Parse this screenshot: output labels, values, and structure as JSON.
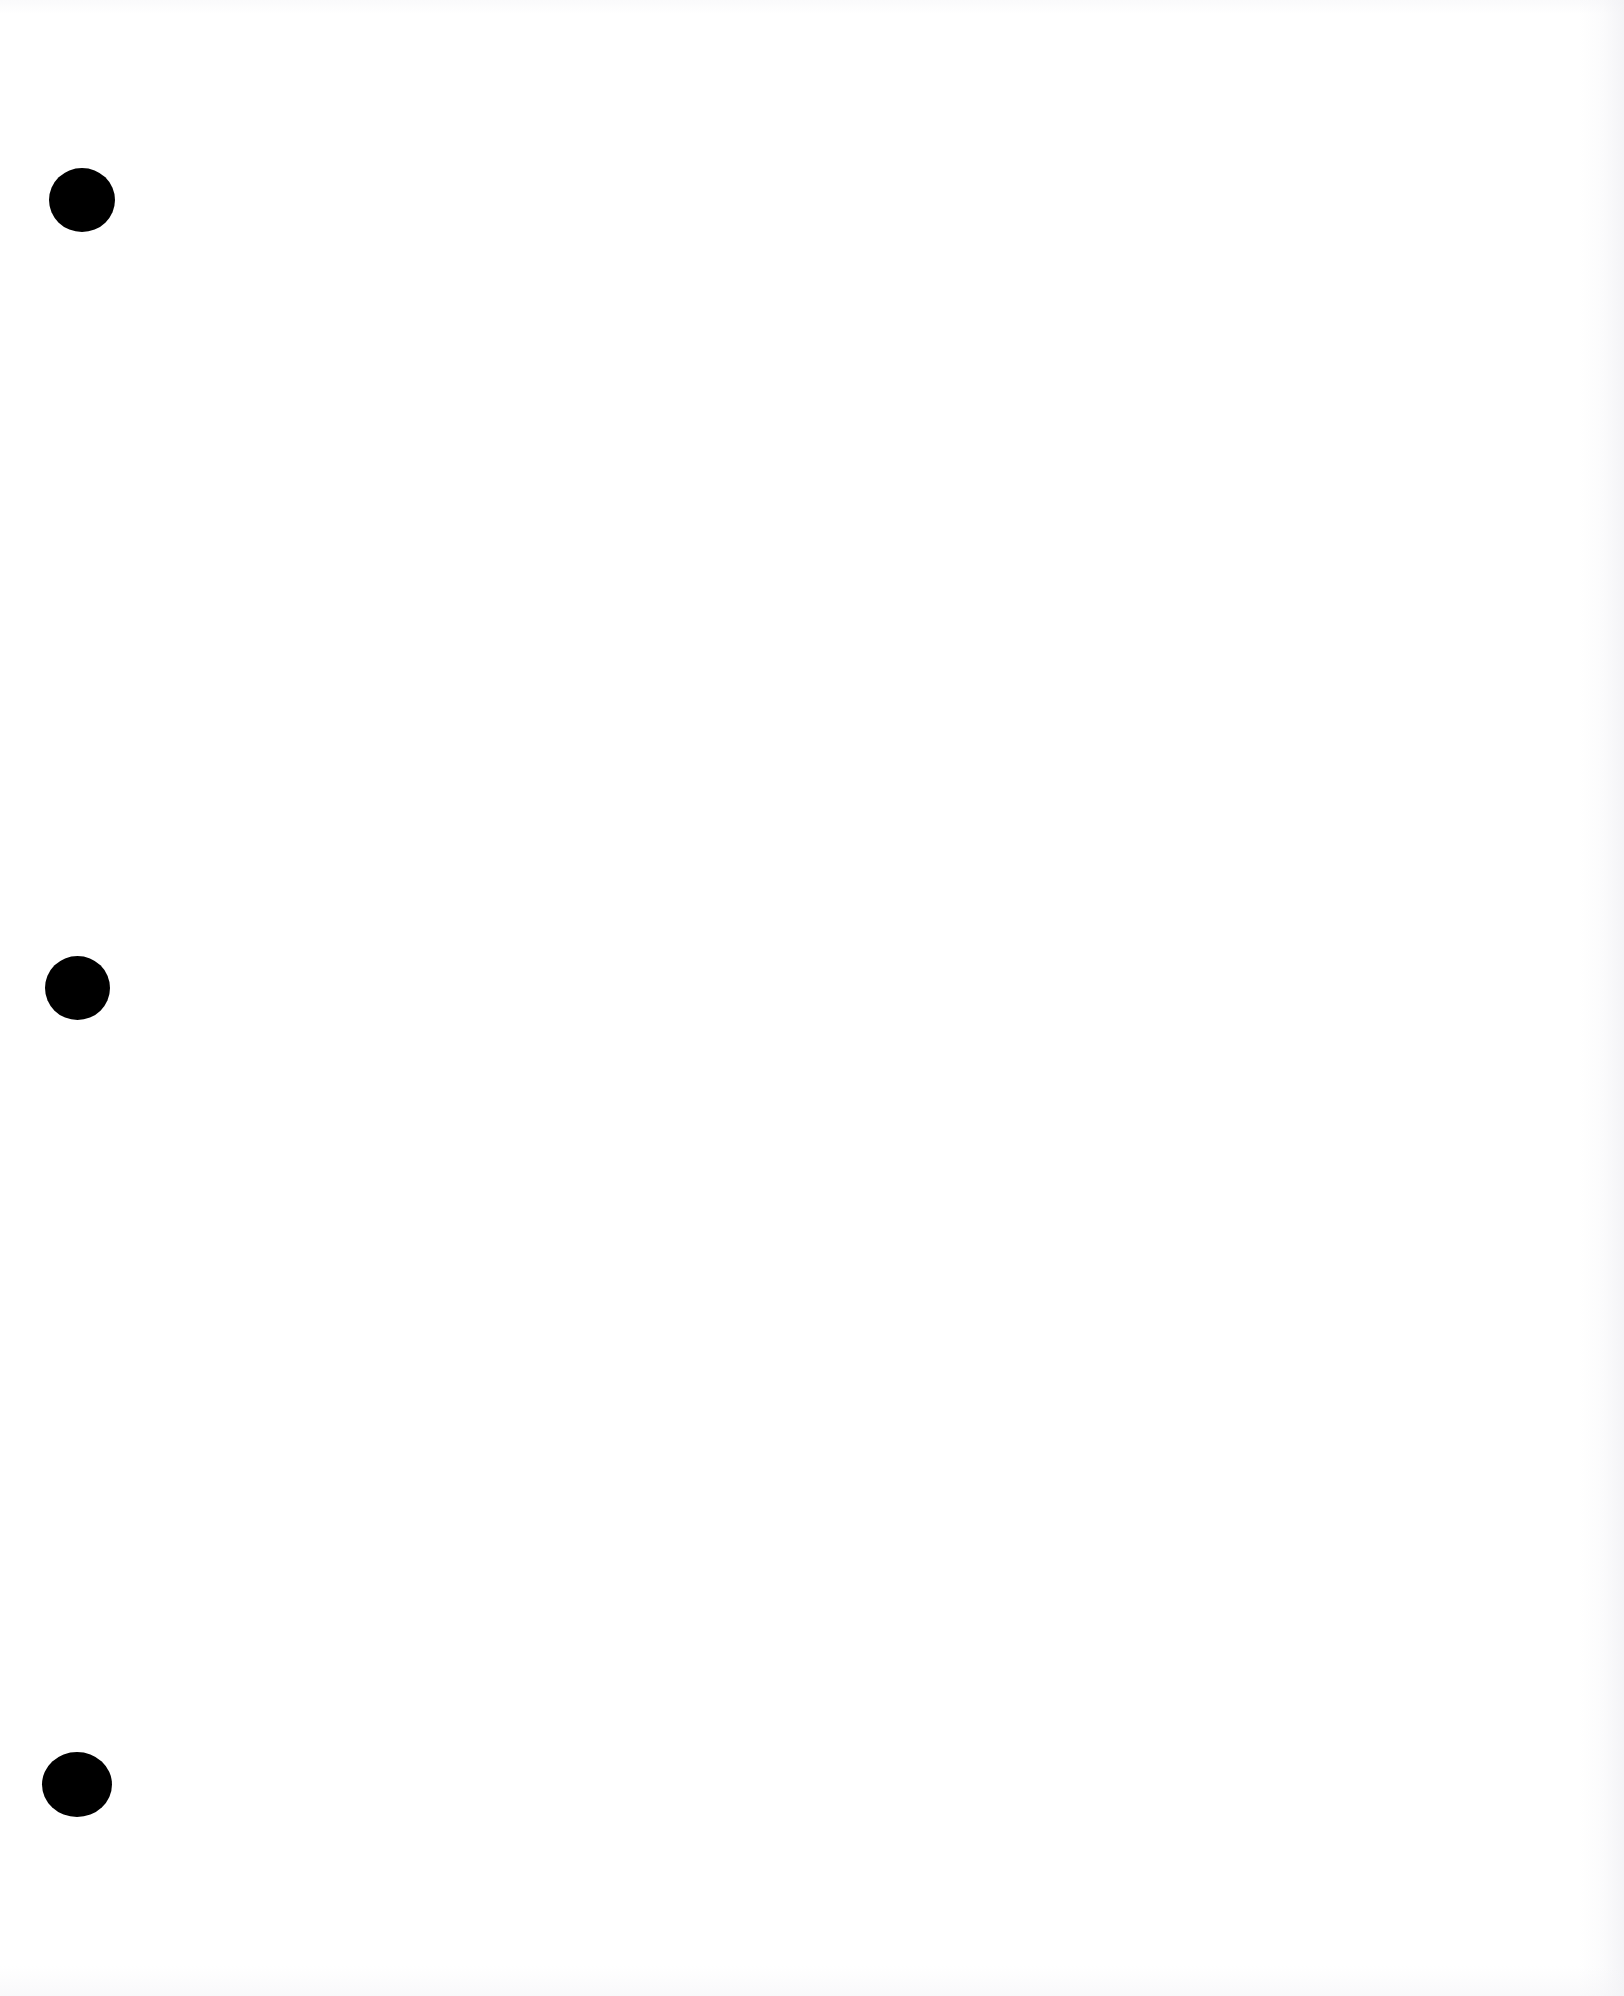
{
  "document": {
    "kind": "scanned-page",
    "page_label": "",
    "body_text": "",
    "background_color": "#ffffff",
    "width": 1624,
    "height": 1996
  },
  "marks": {
    "color": "#000000",
    "shape_name": "filled-circle",
    "count": 3,
    "items": [
      {
        "name": "punch-mark-top",
        "left": 49,
        "top": 168,
        "width": 66,
        "height": 64
      },
      {
        "name": "punch-mark-middle",
        "left": 45,
        "top": 956,
        "width": 65,
        "height": 64
      },
      {
        "name": "punch-mark-bottom",
        "left": 42,
        "top": 1752,
        "width": 70,
        "height": 65
      }
    ]
  },
  "scan_artifacts": {
    "right_edge_visible": true,
    "bottom_edge_visible": true,
    "top_edge_visible": true
  }
}
